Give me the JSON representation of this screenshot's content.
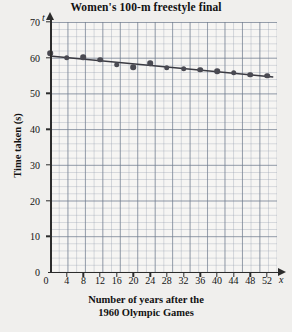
{
  "chart_data": {
    "type": "scatter",
    "title": "Women's 100-m freestyle final",
    "xlabel_line1": "Number of years after the",
    "xlabel_line2": "1960 Olympic Games",
    "ylabel": "Time taken (s)",
    "x_axis_symbol": "x",
    "y_axis_symbol": "t",
    "xlim": [
      0,
      52
    ],
    "ylim": [
      0,
      70
    ],
    "x_ticks": [
      0,
      4,
      8,
      12,
      16,
      20,
      24,
      28,
      32,
      36,
      40,
      44,
      48,
      52
    ],
    "y_ticks": [
      0,
      10,
      20,
      30,
      40,
      50,
      60,
      70
    ],
    "grid": true,
    "grid_minor_step_x": 2,
    "grid_minor_step_y": 2,
    "legend": null,
    "x": [
      0,
      4,
      8,
      12,
      16,
      20,
      24,
      28,
      32,
      36,
      40,
      44,
      48,
      52
    ],
    "values": [
      61.2,
      60.0,
      60.2,
      59.5,
      58.0,
      57.3,
      58.4,
      57.2,
      56.9,
      56.6,
      56.2,
      55.8,
      55.3,
      55.0
    ],
    "series": [
      {
        "name": "Winning time",
        "marker": "filled-circle",
        "color": "#4a4a52",
        "values": [
          61.2,
          60.0,
          60.2,
          59.5,
          58.0,
          57.3,
          58.4,
          57.2,
          56.9,
          56.6,
          56.2,
          55.8,
          55.3,
          55.0
        ]
      }
    ],
    "trend_line": {
      "name": "line of best fit",
      "color": "#3a3a42",
      "x_start": 0,
      "y_start": 60.5,
      "x_end": 53.5,
      "y_end": 54.6
    },
    "colors": {
      "marker": "#4a4a52",
      "trend": "#3a3a42",
      "axis": "#2c2c2c",
      "grid_minor": "#9aa4b0",
      "grid_major": "#6e7a8c",
      "plot_background": "#f6f5f3",
      "page_background": "#f0efed"
    }
  }
}
